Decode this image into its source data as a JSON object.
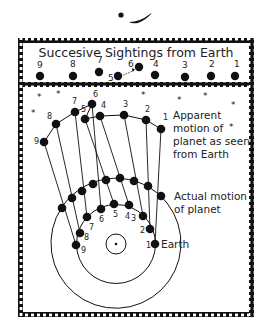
{
  "header": {
    "title": "Succesive Sightings from Earth"
  },
  "sightings": {
    "labels": [
      "9",
      "8",
      "7",
      "6",
      "5",
      "4",
      "3",
      "2",
      "1"
    ]
  },
  "apparent": {
    "label_line1": "Apparent",
    "label_line2": "motion of",
    "label_line3": "planet as seen",
    "label_line4": "from Earth",
    "point_labels": [
      "1",
      "2",
      "3",
      "4",
      "5",
      "6",
      "7",
      "8",
      "9"
    ]
  },
  "actual": {
    "label_line1": "Actual motion",
    "label_line2": "of planet"
  },
  "earth": {
    "label": "Earth",
    "point_labels": [
      "1",
      "2",
      "3",
      "4",
      "5",
      "6",
      "7",
      "8",
      "9"
    ]
  },
  "colors": {
    "ink": "#111111",
    "background": "#ffffff"
  }
}
